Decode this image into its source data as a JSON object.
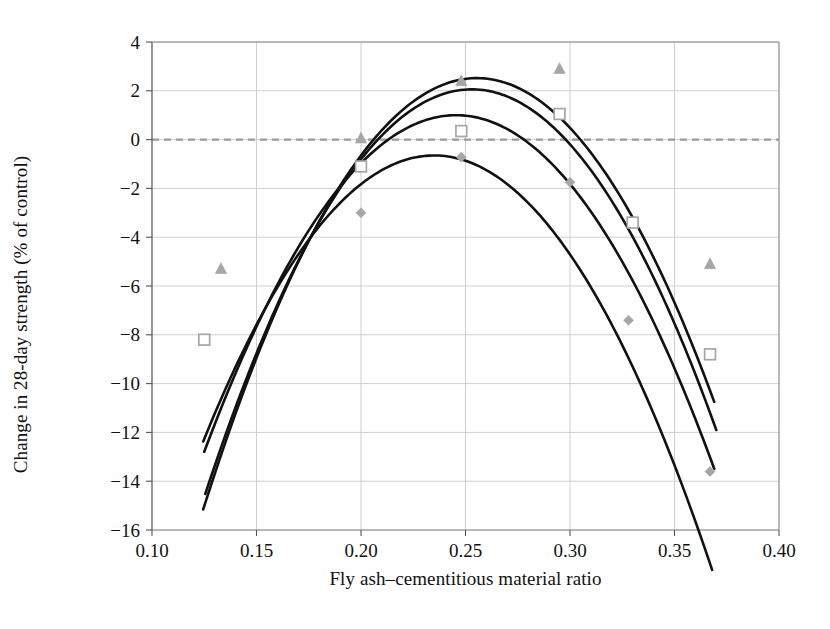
{
  "chart_data": {
    "type": "line",
    "title": "",
    "subtitle": "",
    "xlabel": "Fly ash–cementitious material ratio",
    "ylabel": "Change in 28-day strength (% of control)",
    "xlim": [
      0.1,
      0.4
    ],
    "ylim": [
      -16,
      4
    ],
    "xticks": [
      0.1,
      0.15,
      0.2,
      0.25,
      0.3,
      0.35,
      0.4
    ],
    "xtick_labels": [
      "0.10",
      "0.15",
      "0.20",
      "0.25",
      "0.30",
      "0.35",
      "0.40"
    ],
    "yticks": [
      4,
      2,
      0,
      -2,
      -4,
      -6,
      -8,
      -10,
      -12,
      -14,
      -16
    ],
    "ytick_labels": [
      "4",
      "2",
      "0",
      "−2",
      "−4",
      "−6",
      "−8",
      "−10",
      "−12",
      "−14",
      "−16"
    ],
    "grid": true,
    "grid_color": "#c9c9c9",
    "zero_line": true,
    "zero_line_color": "#9a9a9a",
    "legend": "none",
    "curve_color": "#111111",
    "marker_color": "#a6a6a6",
    "series": [
      {
        "name": "curve-1",
        "marker": "triangle",
        "fit": {
          "vertex_x": 0.2555,
          "vertex_y": 2.52,
          "a": -1030,
          "x_start": 0.1245,
          "x_end": 0.369
        },
        "points": [
          {
            "x": 0.133,
            "y": -5.3
          },
          {
            "x": 0.2,
            "y": 0.05
          },
          {
            "x": 0.248,
            "y": 2.4
          },
          {
            "x": 0.295,
            "y": 2.9
          },
          {
            "x": 0.367,
            "y": -5.1
          }
        ]
      },
      {
        "name": "curve-2",
        "marker": "triangle",
        "fit": {
          "vertex_x": 0.253,
          "vertex_y": 2.06,
          "a": -1020,
          "x_start": 0.1255,
          "x_end": 0.37
        },
        "points": []
      },
      {
        "name": "curve-3",
        "marker": "square",
        "fit": {
          "vertex_x": 0.2455,
          "vertex_y": 1.0,
          "a": -950,
          "x_start": 0.125,
          "x_end": 0.369
        },
        "points": [
          {
            "x": 0.125,
            "y": -8.2
          },
          {
            "x": 0.2,
            "y": -1.1
          },
          {
            "x": 0.248,
            "y": 0.35
          },
          {
            "x": 0.295,
            "y": 1.05
          },
          {
            "x": 0.33,
            "y": -3.4
          },
          {
            "x": 0.367,
            "y": -8.8
          }
        ]
      },
      {
        "name": "curve-4",
        "marker": "diamond",
        "fit": {
          "vertex_x": 0.235,
          "vertex_y": -0.65,
          "a": -960,
          "x_start": 0.1245,
          "x_end": 0.368
        },
        "points": [
          {
            "x": 0.2,
            "y": -3.0
          },
          {
            "x": 0.248,
            "y": -0.72
          },
          {
            "x": 0.3,
            "y": -1.75
          },
          {
            "x": 0.328,
            "y": -7.4
          },
          {
            "x": 0.367,
            "y": -13.6
          }
        ]
      }
    ]
  }
}
